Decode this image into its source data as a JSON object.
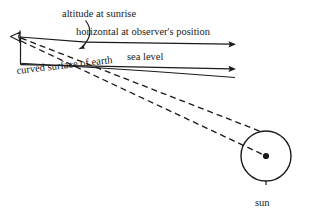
{
  "diagram": {
    "stroke_color": "#1b1b1b",
    "background_color": "#ffffff",
    "labels": {
      "altitude": "altitude at sunrise",
      "horizontal": "horizontal at observer's position",
      "sea_level": "sea level",
      "curved_surface": "curved surface of earth",
      "sun": "sun"
    },
    "elements": {
      "observer_marker": "observer-arrowhead",
      "angle_arc": "altitude-angle-arc",
      "horizontal_ray": "horizontal-ray-arrow",
      "sea_level_ray": "sea-level-ray-arrow",
      "sight_line_upper": "dashed-line-to-sun-limb",
      "sight_line_lower": "dashed-line-to-sun-center",
      "earth_curve": "curved-earth-surface",
      "sun_body": "sun-circle",
      "sun_center": "sun-center-dot"
    },
    "geometry": {
      "observer_x": 20,
      "observer_y": 37,
      "horizontal_ray_end_x": 236,
      "horizontal_ray_y": 44,
      "sea_level_ray_end_x": 236,
      "sea_level_ray_y": 69,
      "sun_center_x": 266,
      "sun_center_y": 156,
      "sun_radius": 25
    }
  }
}
